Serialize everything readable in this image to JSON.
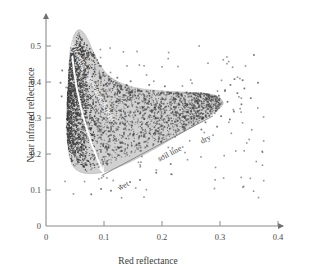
{
  "chart_data": {
    "type": "scatter",
    "title": "",
    "xlabel": "Red reflectance",
    "ylabel": "Near infrared reflectance",
    "xlim": [
      0,
      0.4
    ],
    "ylim": [
      0,
      0.56
    ],
    "xticks": [
      "0",
      "0.1",
      "0.2",
      "0.3",
      "0.4"
    ],
    "xtick_values": [
      0,
      0.1,
      0.2,
      0.3,
      0.4
    ],
    "yticks": [
      "0",
      "0.1",
      "0.2",
      "0.3",
      "0.4",
      "0.5"
    ],
    "ytick_values": [
      0,
      0.1,
      0.2,
      0.3,
      0.4,
      0.5
    ],
    "grid": false,
    "legend": "none",
    "axis_style": "arrow-ended L-shaped axes",
    "annotations": [
      {
        "name": "increasing-vegetation-density",
        "text": "Increasing vegetation density",
        "color": "#ffffff",
        "x": 0.075,
        "y": 0.4,
        "rotation": 62
      },
      {
        "name": "soil-line",
        "text": "soil line",
        "color": "#4a4a4a",
        "x": 0.215,
        "y": 0.195,
        "rotation": -27
      },
      {
        "name": "wet",
        "text": "wet",
        "color": "#4a4a4a",
        "x": 0.135,
        "y": 0.105,
        "rotation": -27
      },
      {
        "name": "dry",
        "text": "dry",
        "color": "#4a4a4a",
        "x": 0.277,
        "y": 0.235,
        "rotation": -27
      }
    ],
    "envelope": {
      "name": "data-density-envelope",
      "fill": "#c9c9c9",
      "description": "tadpole/comma-shaped convex envelope enclosing the scatter cloud",
      "points": [
        [
          0.0395,
          0.43
        ],
        [
          0.0405,
          0.47
        ],
        [
          0.044,
          0.508
        ],
        [
          0.05,
          0.535
        ],
        [
          0.057,
          0.545
        ],
        [
          0.065,
          0.537
        ],
        [
          0.073,
          0.515
        ],
        [
          0.082,
          0.482
        ],
        [
          0.093,
          0.448
        ],
        [
          0.108,
          0.418
        ],
        [
          0.128,
          0.398
        ],
        [
          0.152,
          0.385
        ],
        [
          0.18,
          0.378
        ],
        [
          0.21,
          0.374
        ],
        [
          0.24,
          0.372
        ],
        [
          0.27,
          0.369
        ],
        [
          0.29,
          0.364
        ],
        [
          0.302,
          0.352
        ],
        [
          0.305,
          0.338
        ],
        [
          0.293,
          0.318
        ],
        [
          0.272,
          0.296
        ],
        [
          0.248,
          0.272
        ],
        [
          0.222,
          0.247
        ],
        [
          0.196,
          0.222
        ],
        [
          0.17,
          0.199
        ],
        [
          0.145,
          0.178
        ],
        [
          0.122,
          0.162
        ],
        [
          0.102,
          0.151
        ],
        [
          0.085,
          0.146
        ],
        [
          0.07,
          0.146
        ],
        [
          0.058,
          0.151
        ],
        [
          0.048,
          0.163
        ],
        [
          0.0415,
          0.186
        ],
        [
          0.0375,
          0.225
        ],
        [
          0.0355,
          0.275
        ],
        [
          0.036,
          0.33
        ],
        [
          0.0375,
          0.385
        ]
      ]
    },
    "vegetation_arrow": {
      "name": "vegetation-density-arrow",
      "color": "#ffffff",
      "description": "curved white arrow from high-NIR low-red apex down to the soil line",
      "start": [
        0.0455,
        0.47
      ],
      "control": [
        0.056,
        0.3
      ],
      "end": [
        0.0985,
        0.15
      ]
    },
    "soil_line_segment": {
      "name": "soil-line-segment",
      "color": "#8a8a8a",
      "start": [
        0.096,
        0.14
      ],
      "end": [
        0.288,
        0.306
      ]
    },
    "point_color": "#3d3d3d",
    "point_count_core": 2600,
    "point_count_outliers": 130,
    "series": [
      {
        "name": "core-cloud",
        "description": "dense dark scatter filling the envelope, heaviest between red 0.04-0.07 and NIR 0.17-0.50"
      },
      {
        "name": "outliers",
        "description": "sparse isolated points scattered outside the envelope, mainly red 0.30-0.38, NIR 0.29-0.48"
      }
    ],
    "outlier_points": [
      [
        0.3585,
        0.475
      ],
      [
        0.325,
        0.408
      ],
      [
        0.339,
        0.405
      ],
      [
        0.3655,
        0.398
      ],
      [
        0.318,
        0.392
      ],
      [
        0.342,
        0.382
      ],
      [
        0.3085,
        0.375
      ],
      [
        0.33,
        0.369
      ],
      [
        0.298,
        0.362
      ],
      [
        0.353,
        0.355
      ],
      [
        0.313,
        0.345
      ],
      [
        0.337,
        0.338
      ],
      [
        0.284,
        0.33
      ],
      [
        0.324,
        0.318
      ],
      [
        0.302,
        0.305
      ],
      [
        0.317,
        0.296
      ],
      [
        0.275,
        0.288
      ],
      [
        0.295,
        0.276
      ],
      [
        0.268,
        0.268
      ],
      [
        0.123,
        0.412
      ],
      [
        0.146,
        0.402
      ],
      [
        0.178,
        0.392
      ],
      [
        0.205,
        0.388
      ],
      [
        0.028,
        0.432
      ],
      [
        0.025,
        0.398
      ],
      [
        0.027,
        0.36
      ],
      [
        0.095,
        0.103
      ],
      [
        0.112,
        0.098
      ],
      [
        0.128,
        0.112
      ],
      [
        0.078,
        0.088
      ],
      [
        0.145,
        0.122
      ],
      [
        0.162,
        0.128
      ],
      [
        0.19,
        0.148
      ],
      [
        0.215,
        0.172
      ]
    ]
  },
  "figure": {
    "background": "#ffffff",
    "axis_color": "#8c8c8c",
    "text_color": "#3a3a3a"
  }
}
